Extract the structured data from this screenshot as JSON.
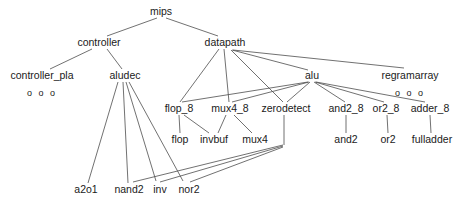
{
  "diagram": {
    "type": "tree",
    "line_color": "#4d4d4d",
    "text_color": "#1a1a1a",
    "background": "#ffffff",
    "nodes": [
      {
        "id": "mips",
        "label": "mips",
        "x": 161,
        "y": 12,
        "level": 0
      },
      {
        "id": "controller",
        "label": "controller",
        "x": 99,
        "y": 43,
        "level": 1
      },
      {
        "id": "datapath",
        "label": "datapath",
        "x": 225,
        "y": 43,
        "level": 1
      },
      {
        "id": "controller_pla",
        "label": "controller_pla",
        "x": 42,
        "y": 76,
        "level": 2
      },
      {
        "id": "aludec",
        "label": "aludec",
        "x": 125,
        "y": 76,
        "level": 2
      },
      {
        "id": "alu",
        "label": "alu",
        "x": 312,
        "y": 76,
        "level": 2
      },
      {
        "id": "regramarray",
        "label": "regramarray",
        "x": 410,
        "y": 76,
        "level": 2
      },
      {
        "id": "flop_8",
        "label": "flop_8",
        "x": 179,
        "y": 109,
        "level": 3
      },
      {
        "id": "mux4_8",
        "label": "mux4_8",
        "x": 230,
        "y": 109,
        "level": 3
      },
      {
        "id": "zerodetect",
        "label": "zerodetect",
        "x": 286,
        "y": 109,
        "level": 3
      },
      {
        "id": "and2_8",
        "label": "and2_8",
        "x": 346,
        "y": 109,
        "level": 3
      },
      {
        "id": "or2_8",
        "label": "or2_8",
        "x": 386,
        "y": 109,
        "level": 3
      },
      {
        "id": "adder_8",
        "label": "adder_8",
        "x": 430,
        "y": 109,
        "level": 3
      },
      {
        "id": "flop",
        "label": "flop",
        "x": 180,
        "y": 140,
        "level": 4
      },
      {
        "id": "invbuf",
        "label": "invbuf",
        "x": 214,
        "y": 140,
        "level": 4
      },
      {
        "id": "mux4",
        "label": "mux4",
        "x": 255,
        "y": 140,
        "level": 4
      },
      {
        "id": "and2",
        "label": "and2",
        "x": 346,
        "y": 140,
        "level": 4
      },
      {
        "id": "or2",
        "label": "or2",
        "x": 388,
        "y": 140,
        "level": 4
      },
      {
        "id": "fulladder",
        "label": "fulladder",
        "x": 432,
        "y": 140,
        "level": 4
      },
      {
        "id": "a2o1",
        "label": "a2o1",
        "x": 86,
        "y": 190,
        "level": 5
      },
      {
        "id": "nand2",
        "label": "nand2",
        "x": 129,
        "y": 190,
        "level": 5
      },
      {
        "id": "inv",
        "label": "inv",
        "x": 160,
        "y": 190,
        "level": 5
      },
      {
        "id": "nor2",
        "label": "nor2",
        "x": 189,
        "y": 190,
        "level": 5
      }
    ],
    "ellipsis_markers": [
      {
        "id": "controller_pla_children",
        "label": "o o o",
        "x": 42,
        "y": 93,
        "parent": "controller_pla"
      },
      {
        "id": "regramarray_children",
        "label": "o o o",
        "x": 410,
        "y": 93,
        "parent": "regramarray"
      }
    ],
    "edges": [
      {
        "from": "mips",
        "to": "controller",
        "x1": 157,
        "y1": 18,
        "x2": 107,
        "y2": 36
      },
      {
        "from": "mips",
        "to": "datapath",
        "x1": 166,
        "y1": 18,
        "x2": 218,
        "y2": 36
      },
      {
        "from": "controller",
        "to": "controller_pla",
        "x1": 92,
        "y1": 49,
        "x2": 50,
        "y2": 69
      },
      {
        "from": "controller",
        "to": "aludec",
        "x1": 107,
        "y1": 49,
        "x2": 122,
        "y2": 69
      },
      {
        "from": "datapath",
        "to": "flop_8",
        "x1": 219,
        "y1": 49,
        "x2": 180,
        "y2": 102
      },
      {
        "from": "datapath",
        "to": "mux4_8",
        "x1": 224,
        "y1": 49,
        "x2": 229,
        "y2": 102
      },
      {
        "from": "datapath",
        "to": "zerodetect",
        "x1": 231,
        "y1": 50,
        "x2": 283,
        "y2": 102
      },
      {
        "from": "datapath",
        "to": "alu",
        "x1": 232,
        "y1": 50,
        "x2": 308,
        "y2": 70
      },
      {
        "from": "datapath",
        "to": "regramarray",
        "x1": 233,
        "y1": 50,
        "x2": 404,
        "y2": 68
      },
      {
        "from": "alu",
        "to": "flop_8",
        "x1": 308,
        "y1": 82,
        "x2": 182,
        "y2": 102
      },
      {
        "from": "alu",
        "to": "mux4_8",
        "x1": 309,
        "y1": 82,
        "x2": 232,
        "y2": 102
      },
      {
        "from": "alu",
        "to": "zerodetect",
        "x1": 310,
        "y1": 82,
        "x2": 287,
        "y2": 102
      },
      {
        "from": "alu",
        "to": "and2_8",
        "x1": 314,
        "y1": 82,
        "x2": 345,
        "y2": 102
      },
      {
        "from": "alu",
        "to": "or2_8",
        "x1": 315,
        "y1": 82,
        "x2": 384,
        "y2": 102
      },
      {
        "from": "alu",
        "to": "adder_8",
        "x1": 316,
        "y1": 82,
        "x2": 425,
        "y2": 102
      },
      {
        "from": "flop_8",
        "to": "flop",
        "x1": 179,
        "y1": 115,
        "x2": 180,
        "y2": 133
      },
      {
        "from": "flop_8",
        "to": "invbuf",
        "x1": 184,
        "y1": 115,
        "x2": 209,
        "y2": 133
      },
      {
        "from": "mux4_8",
        "to": "invbuf",
        "x1": 226,
        "y1": 115,
        "x2": 218,
        "y2": 133
      },
      {
        "from": "mux4_8",
        "to": "mux4",
        "x1": 234,
        "y1": 115,
        "x2": 252,
        "y2": 133
      },
      {
        "from": "and2_8",
        "to": "and2",
        "x1": 346,
        "y1": 115,
        "x2": 346,
        "y2": 133
      },
      {
        "from": "or2_8",
        "to": "or2",
        "x1": 387,
        "y1": 115,
        "x2": 388,
        "y2": 133
      },
      {
        "from": "adder_8",
        "to": "fulladder",
        "x1": 430,
        "y1": 115,
        "x2": 431,
        "y2": 133
      },
      {
        "from": "zerodetect",
        "to": "junction",
        "x1": 284,
        "y1": 115,
        "x2": 284,
        "y2": 145
      },
      {
        "from": "aludec",
        "to": "a2o1",
        "x1": 118,
        "y1": 82,
        "x2": 88,
        "y2": 183
      },
      {
        "from": "aludec",
        "to": "nand2",
        "x1": 123,
        "y1": 82,
        "x2": 128,
        "y2": 183
      },
      {
        "from": "aludec",
        "to": "inv",
        "x1": 126,
        "y1": 82,
        "x2": 156,
        "y2": 181
      },
      {
        "from": "aludec",
        "to": "nor2",
        "x1": 129,
        "y1": 82,
        "x2": 183,
        "y2": 181
      },
      {
        "from": "zerodetect_junction",
        "to": "nand2",
        "x1": 283,
        "y1": 145,
        "x2": 133,
        "y2": 182
      },
      {
        "from": "zerodetect_junction",
        "to": "inv",
        "x1": 283,
        "y1": 146,
        "x2": 160,
        "y2": 182
      },
      {
        "from": "zerodetect_junction",
        "to": "nor2",
        "x1": 283,
        "y1": 147,
        "x2": 190,
        "y2": 182
      }
    ]
  }
}
